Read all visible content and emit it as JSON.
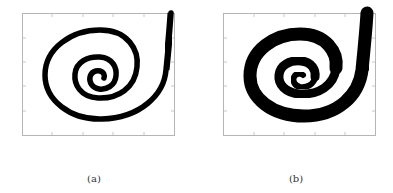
{
  "figure": {
    "panels": [
      {
        "id": "a",
        "caption": "(a)",
        "stroke_description": "thin spiral stroke"
      },
      {
        "id": "b",
        "caption": "(b)",
        "stroke_description": "thick spiral stroke"
      }
    ],
    "colors": {
      "stroke": "#000000",
      "frame": "#b0b0b0",
      "background": "#ffffff"
    }
  }
}
